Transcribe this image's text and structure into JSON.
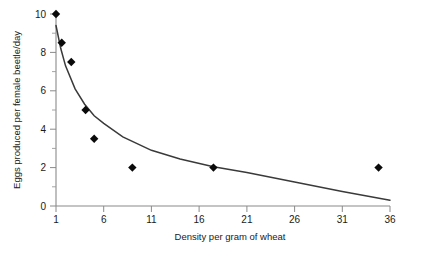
{
  "chart_data": {
    "type": "scatter",
    "title": "",
    "subtitle": "",
    "xlabel": "Density per gram of wheat",
    "ylabel": "Eggs produced per female beetle/day",
    "xlim": [
      1,
      36
    ],
    "ylim": [
      0,
      10
    ],
    "grid": false,
    "legend": false,
    "legend_position": "none",
    "x_ticks": [
      1,
      6,
      11,
      16,
      21,
      26,
      31,
      36
    ],
    "x_tick_labels": [
      "1",
      "6",
      "11",
      "16",
      "21",
      "26",
      "31",
      "36"
    ],
    "y_ticks": [
      0,
      2,
      4,
      6,
      8,
      10
    ],
    "y_tick_labels": [
      "0",
      "2",
      "4",
      "6",
      "8",
      "10"
    ],
    "y_minor_ticks": [
      1,
      3,
      5,
      7,
      9
    ],
    "marker": "diamond",
    "marker_color": "#0a0a0a",
    "curve_color": "#3a3a3a",
    "points": [
      {
        "x": 1.0,
        "y": 10.0
      },
      {
        "x": 1.6,
        "y": 8.5
      },
      {
        "x": 2.6,
        "y": 7.5
      },
      {
        "x": 4.1,
        "y": 5.0
      },
      {
        "x": 5.0,
        "y": 3.5
      },
      {
        "x": 9.0,
        "y": 2.0
      },
      {
        "x": 17.5,
        "y": 2.0
      },
      {
        "x": 34.8,
        "y": 2.0
      }
    ],
    "series": [
      {
        "name": "observed",
        "x": [
          1.0,
          1.6,
          2.6,
          4.1,
          5.0,
          9.0,
          17.5,
          34.8
        ],
        "values": [
          10.0,
          8.5,
          7.5,
          5.0,
          3.5,
          2.0,
          2.0,
          2.0
        ]
      },
      {
        "name": "fitted curve",
        "x": [
          1,
          1.5,
          2,
          3,
          4,
          5,
          6,
          8,
          11,
          14,
          17.5,
          21,
          26,
          31,
          36
        ],
        "values": [
          9.4,
          8.2,
          7.3,
          6.1,
          5.3,
          4.7,
          4.3,
          3.6,
          2.9,
          2.45,
          2.05,
          1.75,
          1.25,
          0.75,
          0.3
        ]
      }
    ]
  }
}
